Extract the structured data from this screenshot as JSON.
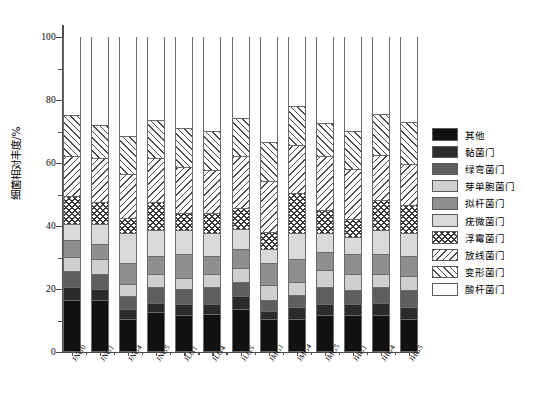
{
  "chart_data": {
    "type": "bar",
    "subtype": "stacked-bar-100",
    "title": "",
    "xlabel": "",
    "ylabel": "细菌相对丰度/%",
    "ylim": [
      0,
      100
    ],
    "yticks": [
      0,
      20,
      40,
      60,
      80,
      100
    ],
    "ytick_labels": [
      "0",
      "20",
      "40",
      "60",
      "80",
      "100"
    ],
    "grid": false,
    "legend_position": "right",
    "categories": [
      "JNG0",
      "JNG1",
      "JNG4",
      "JNG5",
      "JLG1",
      "JLG4",
      "JLG5",
      "JMG1",
      "JMG4",
      "JMG5",
      "JHG1",
      "JHG4",
      "JHG5"
    ],
    "series": [
      {
        "name": "酸杆菌门",
        "fill": "white",
        "color": "#ffffff",
        "values": [
          25.5,
          28.5,
          32.0,
          27.0,
          29.5,
          30.5,
          26.5,
          34.0,
          22.5,
          28.0,
          30.5,
          25.0,
          27.5
        ]
      },
      {
        "name": "变形菌门",
        "fill": "hatch-left",
        "color": "#ffffff",
        "values": [
          13.0,
          10.5,
          12.0,
          12.0,
          12.5,
          12.5,
          12.0,
          12.5,
          12.5,
          10.5,
          12.0,
          13.0,
          13.5
        ]
      },
      {
        "name": "放线菌门",
        "fill": "hatch-right",
        "color": "#ffffff",
        "values": [
          12.5,
          14.0,
          14.0,
          14.0,
          14.5,
          13.5,
          16.5,
          16.0,
          15.0,
          17.0,
          16.0,
          14.5,
          13.0
        ]
      },
      {
        "name": "浮霉菌门",
        "fill": "crosshatch",
        "color": "#ffffff",
        "values": [
          9.0,
          7.0,
          5.0,
          9.0,
          5.5,
          6.5,
          6.5,
          5.5,
          13.0,
          7.5,
          5.5,
          9.5,
          9.0
        ]
      },
      {
        "name": "疣微菌门",
        "fill": "solid",
        "color": "#d9d9d9",
        "values": [
          5.0,
          6.5,
          9.5,
          8.0,
          7.5,
          7.0,
          6.5,
          4.5,
          8.0,
          6.0,
          5.5,
          7.5,
          7.0
        ]
      },
      {
        "name": "拟杆菌门",
        "fill": "solid",
        "color": "#8f8f8f",
        "values": [
          5.5,
          4.5,
          6.5,
          6.0,
          7.5,
          6.0,
          6.0,
          7.0,
          7.5,
          5.5,
          6.5,
          6.5,
          6.5
        ]
      },
      {
        "name": "芽单胞菌门",
        "fill": "solid",
        "color": "#cfcfcf",
        "values": [
          4.5,
          5.0,
          4.0,
          4.0,
          3.5,
          4.0,
          4.5,
          4.5,
          4.0,
          5.5,
          5.0,
          4.0,
          4.5
        ]
      },
      {
        "name": "绿弯菌门",
        "fill": "solid",
        "color": "#5e5e5e",
        "values": [
          5.0,
          4.5,
          4.0,
          5.0,
          5.0,
          5.5,
          4.5,
          3.5,
          4.0,
          5.5,
          4.5,
          5.0,
          5.5
        ]
      },
      {
        "name": "黏菌门",
        "fill": "solid",
        "color": "#2b2b2b",
        "values": [
          4.0,
          3.5,
          3.0,
          3.0,
          3.5,
          3.0,
          4.0,
          2.5,
          3.5,
          3.5,
          3.5,
          4.0,
          3.5
        ]
      },
      {
        "name": "其他",
        "fill": "solid",
        "color": "#111111",
        "values": [
          16.0,
          16.0,
          10.0,
          12.0,
          11.0,
          11.5,
          13.0,
          10.0,
          10.0,
          11.0,
          11.0,
          11.0,
          10.0
        ]
      }
    ]
  },
  "legend": {
    "items": [
      {
        "label": "其他"
      },
      {
        "label": "黏菌门"
      },
      {
        "label": "绿弯菌门"
      },
      {
        "label": "芽单胞菌门"
      },
      {
        "label": "拟杆菌门"
      },
      {
        "label": "疣微菌门"
      },
      {
        "label": "浮霉菌门"
      },
      {
        "label": "放线菌门"
      },
      {
        "label": "变形菌门"
      },
      {
        "label": "酸杆菌门"
      }
    ]
  }
}
